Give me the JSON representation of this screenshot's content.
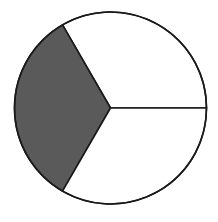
{
  "diagram": {
    "type": "fraction-circle",
    "total_parts": 3,
    "shaded_parts": 1,
    "fraction_shaded": "1/3",
    "shaded_sector_index": 1,
    "start_angle_deg": 0,
    "colors": {
      "shaded": "#5a5a5a",
      "unshaded": "#ffffff",
      "stroke": "#1a1a1a"
    }
  }
}
